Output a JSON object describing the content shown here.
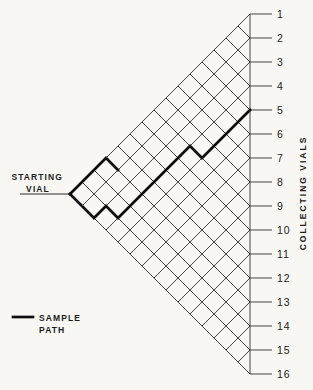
{
  "figure": {
    "labels": {
      "starting_vial_line1": "STARTING",
      "starting_vial_line2": "VIAL",
      "collecting_vials": "COLLECTING  VIALS",
      "legend_line1": "SAMPLE",
      "legend_line2": "PATH"
    },
    "collecting_vials": {
      "labels": [
        "1",
        "2",
        "3",
        "4",
        "5",
        "6",
        "7",
        "8",
        "9",
        "10",
        "11",
        "12",
        "13",
        "14",
        "15",
        "16"
      ],
      "count": 16
    },
    "lattice": {
      "apex_x": 70,
      "apex_y": 194,
      "step": 12,
      "transfers": 15,
      "right_edge_x": 250,
      "tick_end_x": 272,
      "label_x": 277,
      "leader_start_x": 20
    },
    "sample_path": {
      "moves": "DDUDUUUUUUDUUUU",
      "end_vial": 5,
      "branch_moves": "UUUD"
    },
    "colors": {
      "grid": "#2f2f2f",
      "path": "#0d0d0d",
      "text": "#1c1c1c",
      "background": "#f8f7f4"
    }
  }
}
